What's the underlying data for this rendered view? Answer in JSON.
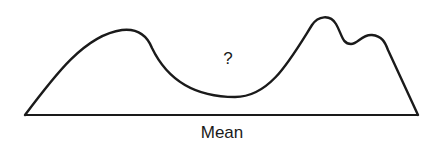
{
  "diagram": {
    "type": "distribution-curve",
    "curve_annotation": "?",
    "baseline_label": "Mean",
    "stroke_color": "#1a1a1a",
    "background": "#ffffff"
  }
}
